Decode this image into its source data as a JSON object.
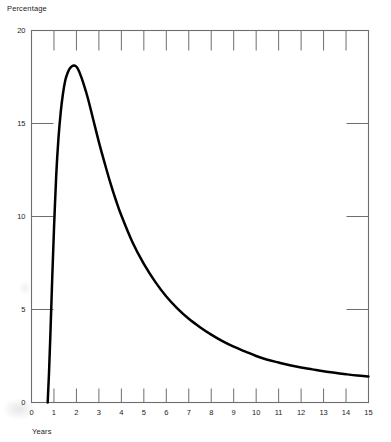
{
  "chart_data": {
    "type": "line",
    "title": "",
    "ylabel": "Percentage",
    "xlabel": "Years",
    "xlim": [
      0,
      15
    ],
    "ylim": [
      0,
      20
    ],
    "grid": false,
    "legend": null,
    "x_ticks": [
      "0",
      "1",
      "2",
      "3",
      "4",
      "5",
      "6",
      "7",
      "8",
      "9",
      "10",
      "11",
      "12",
      "13",
      "14",
      "15"
    ],
    "y_ticks": [
      "0",
      "5",
      "10",
      "15",
      "20"
    ],
    "x_tick_values": [
      0,
      1,
      2,
      3,
      4,
      5,
      6,
      7,
      8,
      9,
      10,
      11,
      12,
      13,
      14,
      15
    ],
    "y_tick_values": [
      0,
      5,
      10,
      15,
      20
    ],
    "series": [
      {
        "name": "Percentage",
        "color": "#000000",
        "x": [
          0.72,
          0.78,
          0.85,
          0.92,
          1.0,
          1.1,
          1.2,
          1.3,
          1.4,
          1.5,
          1.6,
          1.7,
          1.8,
          1.9,
          2.0,
          2.1,
          2.2,
          2.3,
          2.5,
          2.75,
          3.0,
          3.25,
          3.5,
          3.75,
          4.0,
          4.5,
          5.0,
          5.5,
          6.0,
          6.5,
          7.0,
          7.5,
          8.0,
          8.5,
          9.0,
          9.5,
          10.0,
          10.5,
          11.0,
          11.5,
          12.0,
          12.5,
          13.0,
          13.5,
          14.0,
          14.5,
          15.0
        ],
        "y": [
          0.0,
          1.6,
          4.0,
          6.6,
          9.3,
          12.2,
          14.2,
          15.6,
          16.6,
          17.3,
          17.7,
          17.95,
          18.08,
          18.12,
          18.05,
          17.85,
          17.55,
          17.2,
          16.4,
          15.2,
          14.0,
          12.9,
          11.85,
          10.9,
          10.05,
          8.6,
          7.45,
          6.5,
          5.7,
          5.05,
          4.5,
          4.05,
          3.65,
          3.3,
          3.0,
          2.75,
          2.5,
          2.3,
          2.15,
          2.0,
          1.88,
          1.78,
          1.68,
          1.6,
          1.52,
          1.45,
          1.4
        ]
      }
    ]
  },
  "plot": {
    "frame_color": "#6e6e6e",
    "curve_color": "#000000",
    "background": "#ffffff"
  }
}
